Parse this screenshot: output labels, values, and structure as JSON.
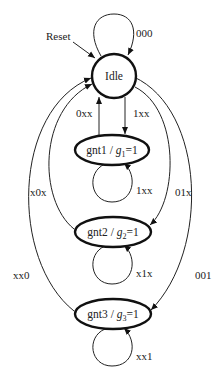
{
  "diagram": {
    "type": "state-machine",
    "reset_label": "Reset",
    "nodes": [
      {
        "id": "idle",
        "label": "Idle",
        "output": ""
      },
      {
        "id": "gnt1",
        "label": "gnt1",
        "output_var": "g",
        "output_sub": "1",
        "output_val": "=1"
      },
      {
        "id": "gnt2",
        "label": "gnt2",
        "output_var": "g",
        "output_sub": "2",
        "output_val": "=1"
      },
      {
        "id": "gnt3",
        "label": "gnt3",
        "output_var": "g",
        "output_sub": "3",
        "output_val": "=1"
      }
    ],
    "edges": [
      {
        "from": "idle",
        "to": "idle",
        "label": "000"
      },
      {
        "from": "idle",
        "to": "gnt1",
        "label": "1xx"
      },
      {
        "from": "gnt1",
        "to": "idle",
        "label": "0xx"
      },
      {
        "from": "gnt1",
        "to": "gnt1",
        "label": "1xx"
      },
      {
        "from": "idle",
        "to": "gnt2",
        "label": "01x"
      },
      {
        "from": "gnt2",
        "to": "idle",
        "label": "x0x"
      },
      {
        "from": "gnt2",
        "to": "gnt2",
        "label": "x1x"
      },
      {
        "from": "idle",
        "to": "gnt3",
        "label": "001"
      },
      {
        "from": "gnt3",
        "to": "idle",
        "label": "xx0"
      },
      {
        "from": "gnt3",
        "to": "gnt3",
        "label": "xx1"
      }
    ]
  }
}
